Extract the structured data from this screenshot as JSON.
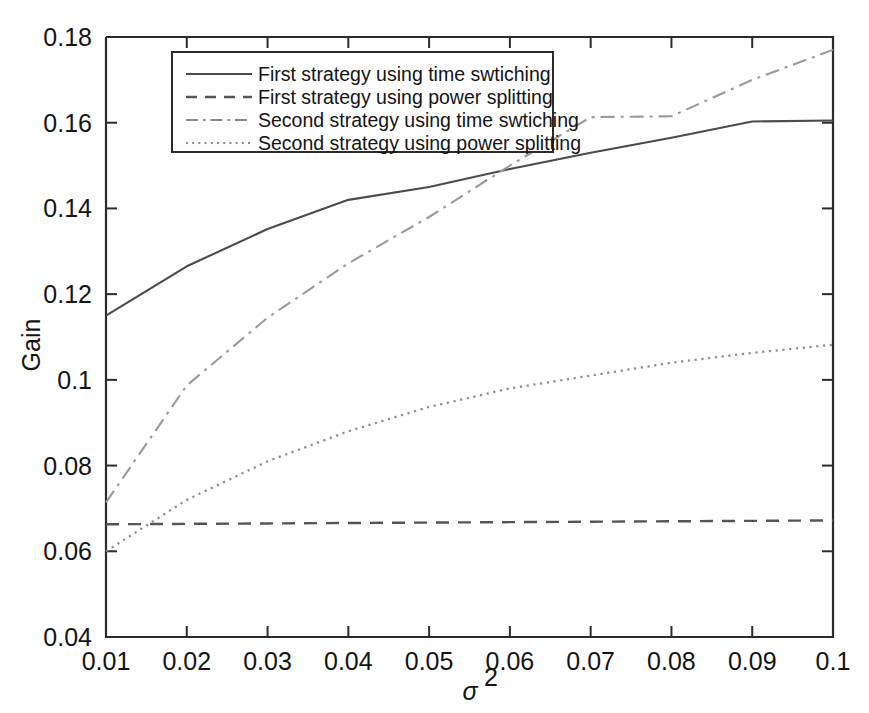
{
  "chart_data": {
    "type": "line",
    "title": "",
    "xlabel": "σ²",
    "ylabel": "Gain",
    "xlim": [
      0.01,
      0.1
    ],
    "ylim": [
      0.04,
      0.18
    ],
    "xticks": [
      "0.01",
      "0.02",
      "0.03",
      "0.04",
      "0.05",
      "0.06",
      "0.07",
      "0.08",
      "0.09",
      "0.1"
    ],
    "yticks": [
      "0.04",
      "0.06",
      "0.08",
      "0.1",
      "0.12",
      "0.14",
      "0.16",
      "0.18"
    ],
    "xtick_values": [
      0.01,
      0.02,
      0.03,
      0.04,
      0.05,
      0.06,
      0.07,
      0.08,
      0.09,
      0.1
    ],
    "ytick_values": [
      0.04,
      0.06,
      0.08,
      0.1,
      0.12,
      0.14,
      0.16,
      0.18
    ],
    "grid": false,
    "legend_position": "top-center-left",
    "x": [
      0.01,
      0.02,
      0.03,
      0.04,
      0.05,
      0.06,
      0.07,
      0.08,
      0.09,
      0.1
    ],
    "series": [
      {
        "name": "First strategy using time swtiching",
        "style": "solid",
        "color": "#4b4b4b",
        "values": [
          0.115,
          0.1265,
          0.1352,
          0.142,
          0.145,
          0.1492,
          0.153,
          0.1565,
          0.1603,
          0.1605
        ]
      },
      {
        "name": "First strategy using power splitting",
        "style": "dashed",
        "color": "#555555",
        "values": [
          0.0663,
          0.0664,
          0.0665,
          0.0666,
          0.0667,
          0.0668,
          0.0669,
          0.067,
          0.0671,
          0.0672
        ]
      },
      {
        "name": "Second strategy using time swtiching",
        "style": "dashdot",
        "color": "#9a9a9a",
        "values": [
          0.0714,
          0.0987,
          0.1145,
          0.1272,
          0.138,
          0.15,
          0.1613,
          0.1615,
          0.17,
          0.177
        ]
      },
      {
        "name": "Second strategy using power splitting",
        "style": "dotted",
        "color": "#8e8e8e",
        "values": [
          0.06,
          0.072,
          0.081,
          0.088,
          0.0937,
          0.098,
          0.101,
          0.104,
          0.1063,
          0.1082
        ]
      }
    ],
    "annotations": []
  },
  "legend": {
    "entries": [
      {
        "label": "First strategy using time swtiching"
      },
      {
        "label": "First strategy using power splitting"
      },
      {
        "label": "Second strategy using time swtiching"
      },
      {
        "label": "Second strategy using power splitting"
      }
    ]
  },
  "axes": {
    "y_axis_label": "Gain",
    "x_axis_label_base": "σ",
    "x_axis_label_exp": "2"
  }
}
